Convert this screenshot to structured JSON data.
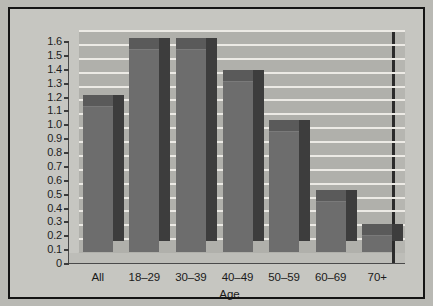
{
  "figure": {
    "background_color": "#c6c6c1",
    "frame_color": "#141414"
  },
  "chart_data": {
    "type": "bar",
    "title": "",
    "xlabel": "Age",
    "ylabel": "Frequency of sexual intercourse per week",
    "categories": [
      "All",
      "18–29",
      "30–39",
      "40–49",
      "50–59",
      "60–69",
      "70+"
    ],
    "values": [
      1.05,
      1.46,
      1.46,
      1.23,
      0.87,
      0.37,
      0.12
    ],
    "ylim": [
      0,
      1.6
    ],
    "ytick_labels": [
      "1.6",
      "1.5",
      "1.4",
      "1.3",
      "1.2",
      "1.1",
      "1.0",
      "0.9",
      "0.8",
      "0.7",
      "0.6",
      "0.5",
      "0.4",
      "0.3",
      "0.2",
      "0.1",
      "0"
    ],
    "ytick_values": [
      1.6,
      1.5,
      1.4,
      1.3,
      1.2,
      1.1,
      1.0,
      0.9,
      0.8,
      0.7,
      0.6,
      0.5,
      0.4,
      0.3,
      0.2,
      0.1,
      0
    ],
    "grid": true,
    "legend": "none",
    "style": "3d-bar",
    "bar_face_color": "#6d6d6d",
    "bar_side_color": "#3d3d3d",
    "bar_top_color": "#5a5a5a",
    "plot_background_color": "#b0b0ab",
    "gridline_color": "#eceae5"
  }
}
